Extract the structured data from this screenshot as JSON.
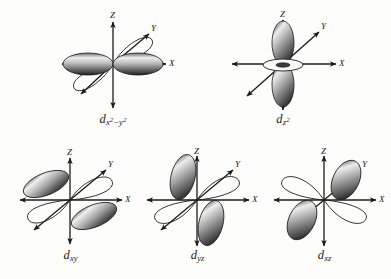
{
  "figure": {
    "background_color": "#fdfdfc",
    "ink_color": "#1b1b1b",
    "lobe_dark_color": "#2b2b2b",
    "lobe_light_color": "#f2f2f2"
  },
  "axes": {
    "x_label": "X",
    "y_label": "Y",
    "z_label": "Z"
  },
  "orbitals": [
    {
      "id": "dx2-y2",
      "name": "d x squared minus y squared",
      "base": "d",
      "sub_1": "x",
      "sup_1": "2",
      "minus": "−",
      "sub_2": "y",
      "sup_2": "2",
      "row": 1,
      "column": 1,
      "shaded_lobe_direction": "along X axis (left and right)",
      "outline_lobe_direction": "along Y axis (upper-right and lower-left diagonal)",
      "has_torus": false
    },
    {
      "id": "dz2",
      "name": "d z squared",
      "base": "d",
      "sub_1": "z",
      "sup_1": "2",
      "row": 1,
      "column": 2,
      "shaded_lobe_direction": "along Z axis (up and down)",
      "outline_lobe_direction": "none",
      "has_torus": true
    },
    {
      "id": "dxy",
      "name": "d x y",
      "base": "d",
      "sub_1": "xy",
      "row": 2,
      "column": 1,
      "shaded_lobe_direction": "upper-left and lower-right",
      "outline_lobe_direction": "upper-right and lower-left",
      "has_torus": false
    },
    {
      "id": "dyz",
      "name": "d y z",
      "base": "d",
      "sub_1": "yz",
      "row": 2,
      "column": 2,
      "shaded_lobe_direction": "upper-left and lower-right, steeply inclined",
      "outline_lobe_direction": "upper-right and lower-left",
      "has_torus": false
    },
    {
      "id": "dxz",
      "name": "d x z",
      "base": "d",
      "sub_1": "xz",
      "row": 2,
      "column": 3,
      "shaded_lobe_direction": "upper-right and lower-left",
      "outline_lobe_direction": "upper-left and lower-right",
      "has_torus": false
    }
  ]
}
